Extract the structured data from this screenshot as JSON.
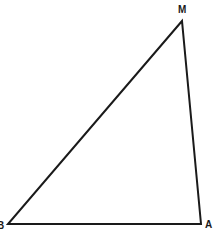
{
  "diagram": {
    "type": "triangle",
    "stroke_color": "#1a1a1a",
    "background": "#ffffff",
    "vertices": [
      {
        "label": "M",
        "x": 182,
        "y": 21,
        "label_x": 178,
        "label_y": 13
      },
      {
        "label": "B",
        "x": 8,
        "y": 224,
        "label_x": -3,
        "label_y": 229
      },
      {
        "label": "A",
        "x": 201,
        "y": 224,
        "label_x": 205,
        "label_y": 228
      }
    ],
    "edges": [
      {
        "from": "M",
        "to": "B"
      },
      {
        "from": "B",
        "to": "A"
      },
      {
        "from": "A",
        "to": "M"
      }
    ]
  }
}
